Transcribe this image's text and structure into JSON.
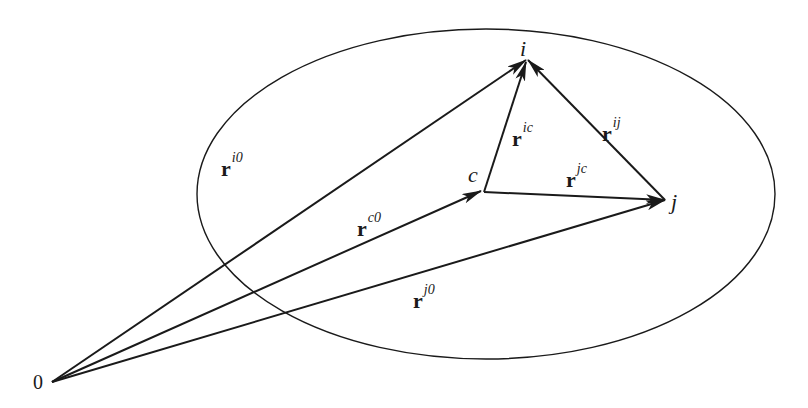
{
  "diagram": {
    "colors": {
      "stroke": "#1a1a1a",
      "background": "#ffffff"
    },
    "points": {
      "origin": {
        "label": "0"
      },
      "i": {
        "label": "i"
      },
      "c": {
        "label": "c"
      },
      "j": {
        "label": "j"
      }
    },
    "vectors": [
      {
        "id": "r_i0",
        "base": "r",
        "sup": "i0",
        "from": "0",
        "to": "i"
      },
      {
        "id": "r_c0",
        "base": "r",
        "sup": "c0",
        "from": "0",
        "to": "c"
      },
      {
        "id": "r_j0",
        "base": "r",
        "sup": "j0",
        "from": "0",
        "to": "j"
      },
      {
        "id": "r_ic",
        "base": "r",
        "sup": "ic",
        "from": "c",
        "to": "i"
      },
      {
        "id": "r_jc",
        "base": "r",
        "sup": "jc",
        "from": "c",
        "to": "j"
      },
      {
        "id": "r_ij",
        "base": "r",
        "sup": "ij",
        "from": "j",
        "to": "i"
      }
    ]
  }
}
